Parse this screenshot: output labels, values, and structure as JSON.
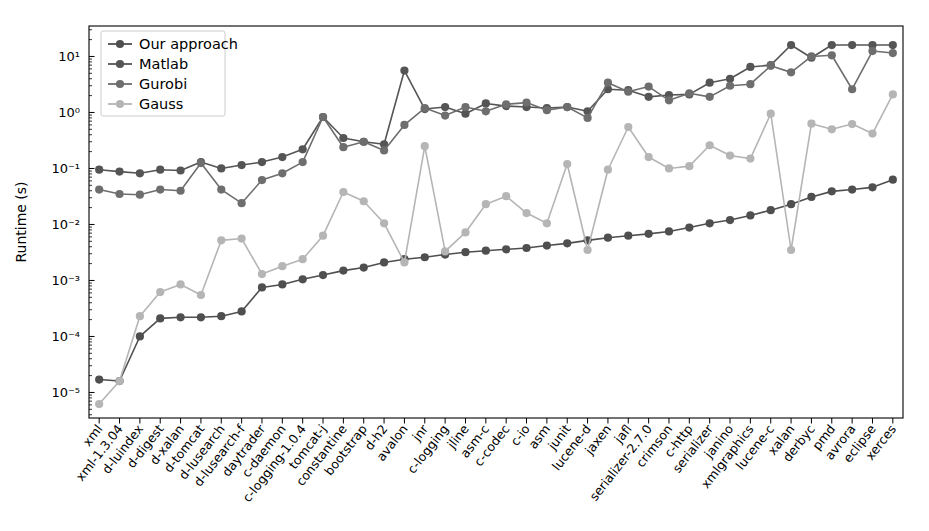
{
  "chart_data": {
    "type": "line",
    "title": "",
    "xlabel": "",
    "ylabel": "Runtime (s)",
    "yscale": "log",
    "ylim": [
      3.5e-06,
      35
    ],
    "grid": false,
    "legend_position": "upper-left",
    "categories": [
      "xml",
      "xml-1.3.04",
      "d-luindex",
      "d-digest",
      "d-xalan",
      "d-tomcat",
      "d-lusearch",
      "d-lusearch-f",
      "daytrader",
      "c-daemon",
      "c-logging-1.0.4",
      "tomcat-j",
      "constantine",
      "bootstrap",
      "d-h2",
      "avalon",
      "jnr",
      "c-logging",
      "jline",
      "asm-c",
      "c-codec",
      "c-io",
      "asm",
      "junit",
      "lucene-d",
      "jaxen",
      "jafl",
      "serializer-2.7.0",
      "crimson",
      "c-http",
      "serializer",
      "janino",
      "xmlgraphics",
      "lucene-c",
      "xalan",
      "derbyc",
      "pmd",
      "avrora",
      "eclipse",
      "xerces"
    ],
    "series": [
      {
        "name": "Our approach",
        "color": "#4f4f4f",
        "values": [
          1.7e-05,
          1.6e-05,
          0.0001,
          0.00021,
          0.00022,
          0.00022,
          0.00023,
          0.00028,
          0.00075,
          0.00085,
          0.00105,
          0.00125,
          0.0015,
          0.0017,
          0.0021,
          0.0024,
          0.0026,
          0.0029,
          0.0032,
          0.0034,
          0.0036,
          0.0038,
          0.0042,
          0.0046,
          0.0052,
          0.0058,
          0.0063,
          0.0068,
          0.0075,
          0.0088,
          0.0105,
          0.012,
          0.0145,
          0.018,
          0.023,
          0.031,
          0.039,
          0.042,
          0.046,
          0.063
        ]
      },
      {
        "name": "Matlab",
        "color": "#555555",
        "values": [
          0.095,
          0.088,
          0.082,
          0.095,
          0.092,
          0.13,
          0.1,
          0.115,
          0.13,
          0.16,
          0.22,
          0.83,
          0.35,
          0.3,
          0.27,
          5.6,
          1.15,
          1.25,
          0.95,
          1.45,
          1.3,
          1.25,
          1.2,
          1.25,
          1.05,
          2.6,
          2.5,
          1.9,
          2.05,
          2.1,
          3.4,
          4.0,
          6.5,
          7.0,
          16.0,
          9.5,
          16.0,
          16.0,
          16.0,
          16.0
        ]
      },
      {
        "name": "Gurobi",
        "color": "#6e6e6e",
        "values": [
          0.042,
          0.035,
          0.034,
          0.042,
          0.04,
          0.125,
          0.042,
          0.024,
          0.062,
          0.082,
          0.13,
          0.83,
          0.24,
          0.3,
          0.21,
          0.6,
          1.2,
          0.88,
          1.25,
          1.05,
          1.4,
          1.5,
          1.1,
          1.25,
          0.8,
          3.4,
          2.35,
          2.9,
          1.65,
          2.2,
          1.9,
          3.0,
          3.2,
          6.8,
          5.2,
          10.0,
          10.5,
          2.6,
          12.5,
          11.5
        ]
      },
      {
        "name": "Gauss",
        "color": "#b5b5b5",
        "values": [
          6.2e-06,
          1.6e-05,
          0.00023,
          0.00062,
          0.00085,
          0.00055,
          0.0052,
          0.0056,
          0.0013,
          0.0018,
          0.0024,
          0.0063,
          0.038,
          0.026,
          0.0105,
          0.0021,
          0.25,
          0.0033,
          0.0072,
          0.023,
          0.032,
          0.016,
          0.0105,
          0.12,
          0.0035,
          0.095,
          0.55,
          0.16,
          0.1,
          0.11,
          0.26,
          0.17,
          0.15,
          0.95,
          0.0035,
          0.63,
          0.5,
          0.62,
          0.42,
          2.1
        ]
      }
    ]
  },
  "legend": {
    "items": [
      {
        "label": "Our approach"
      },
      {
        "label": "Matlab"
      },
      {
        "label": "Gurobi"
      },
      {
        "label": "Gauss"
      }
    ]
  },
  "yaxis": {
    "ticks": [
      {
        "label": "10¹",
        "value": 10
      },
      {
        "label": "10⁰",
        "value": 1
      },
      {
        "label": "10⁻¹",
        "value": 0.1
      },
      {
        "label": "10⁻²",
        "value": 0.01
      },
      {
        "label": "10⁻³",
        "value": 0.001
      },
      {
        "label": "10⁻⁴",
        "value": 0.0001
      },
      {
        "label": "10⁻⁵",
        "value": 1e-05
      }
    ]
  }
}
